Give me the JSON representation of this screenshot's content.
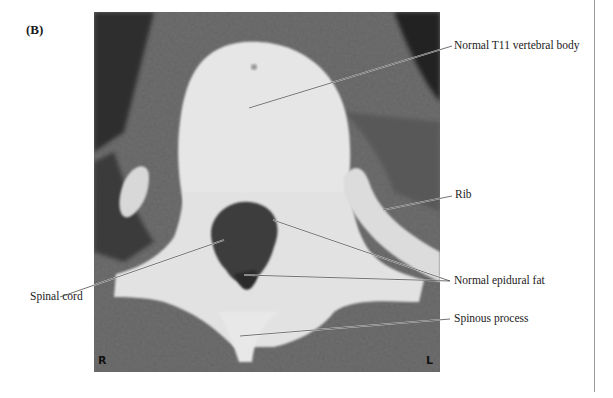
{
  "figure": {
    "panel_label": "(B)",
    "orientation": {
      "right_marker": "R",
      "left_marker": "L"
    },
    "labels": [
      {
        "id": "vertebral-body",
        "text": "Normal T11 vertebral body"
      },
      {
        "id": "rib",
        "text": "Rib"
      },
      {
        "id": "spinal-cord",
        "text": "Spinal cord"
      },
      {
        "id": "epidural-fat",
        "text": "Normal epidural fat"
      },
      {
        "id": "spinous-process",
        "text": "Spinous process"
      }
    ]
  }
}
